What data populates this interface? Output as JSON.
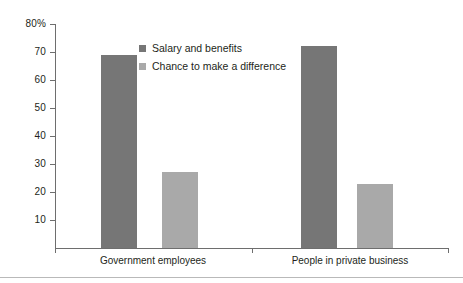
{
  "chart_data": {
    "type": "bar",
    "title": "",
    "subtitle": "",
    "xlabel": "",
    "ylabel": "",
    "categories": [
      "Government employees",
      "People in private business"
    ],
    "series": [
      {
        "name": "Salary and benefits",
        "values": [
          69,
          72
        ],
        "color": "#767676"
      },
      {
        "name": "Chance to make a difference",
        "values": [
          27,
          23
        ],
        "color": "#a9a9a9"
      }
    ],
    "ylim": [
      0,
      80
    ],
    "ytick_values": [
      80,
      70,
      60,
      50,
      40,
      30,
      20,
      10
    ],
    "ytick_labels": [
      "80%",
      "70",
      "60",
      "50",
      "40",
      "30",
      "20",
      "10"
    ],
    "grid": false,
    "legend_position": "upper-center-left",
    "orientation": "vertical",
    "units": "percent"
  },
  "axes": {
    "y": {
      "ticks": [
        {
          "label": "80%",
          "value": 80
        },
        {
          "label": "70",
          "value": 70
        },
        {
          "label": "60",
          "value": 60
        },
        {
          "label": "50",
          "value": 50
        },
        {
          "label": "40",
          "value": 40
        },
        {
          "label": "30",
          "value": 30
        },
        {
          "label": "20",
          "value": 20
        },
        {
          "label": "10",
          "value": 10
        }
      ]
    },
    "x": {
      "categories": [
        {
          "label": "Government employees"
        },
        {
          "label": "People in private business"
        }
      ]
    }
  },
  "legend": {
    "items": [
      {
        "label": "Salary and benefits",
        "swatch": "dark"
      },
      {
        "label": "Chance to make a difference",
        "swatch": "light"
      }
    ]
  },
  "bars": [
    {
      "name": "bar-gov-salary",
      "value": 69,
      "series": "Salary and benefits",
      "category": "Government employees"
    },
    {
      "name": "bar-gov-difference",
      "value": 27,
      "series": "Chance to make a difference",
      "category": "Government employees"
    },
    {
      "name": "bar-priv-salary",
      "value": 72,
      "series": "Salary and benefits",
      "category": "People in private business"
    },
    {
      "name": "bar-priv-difference",
      "value": 23,
      "series": "Chance to make a difference",
      "category": "People in private business"
    }
  ]
}
